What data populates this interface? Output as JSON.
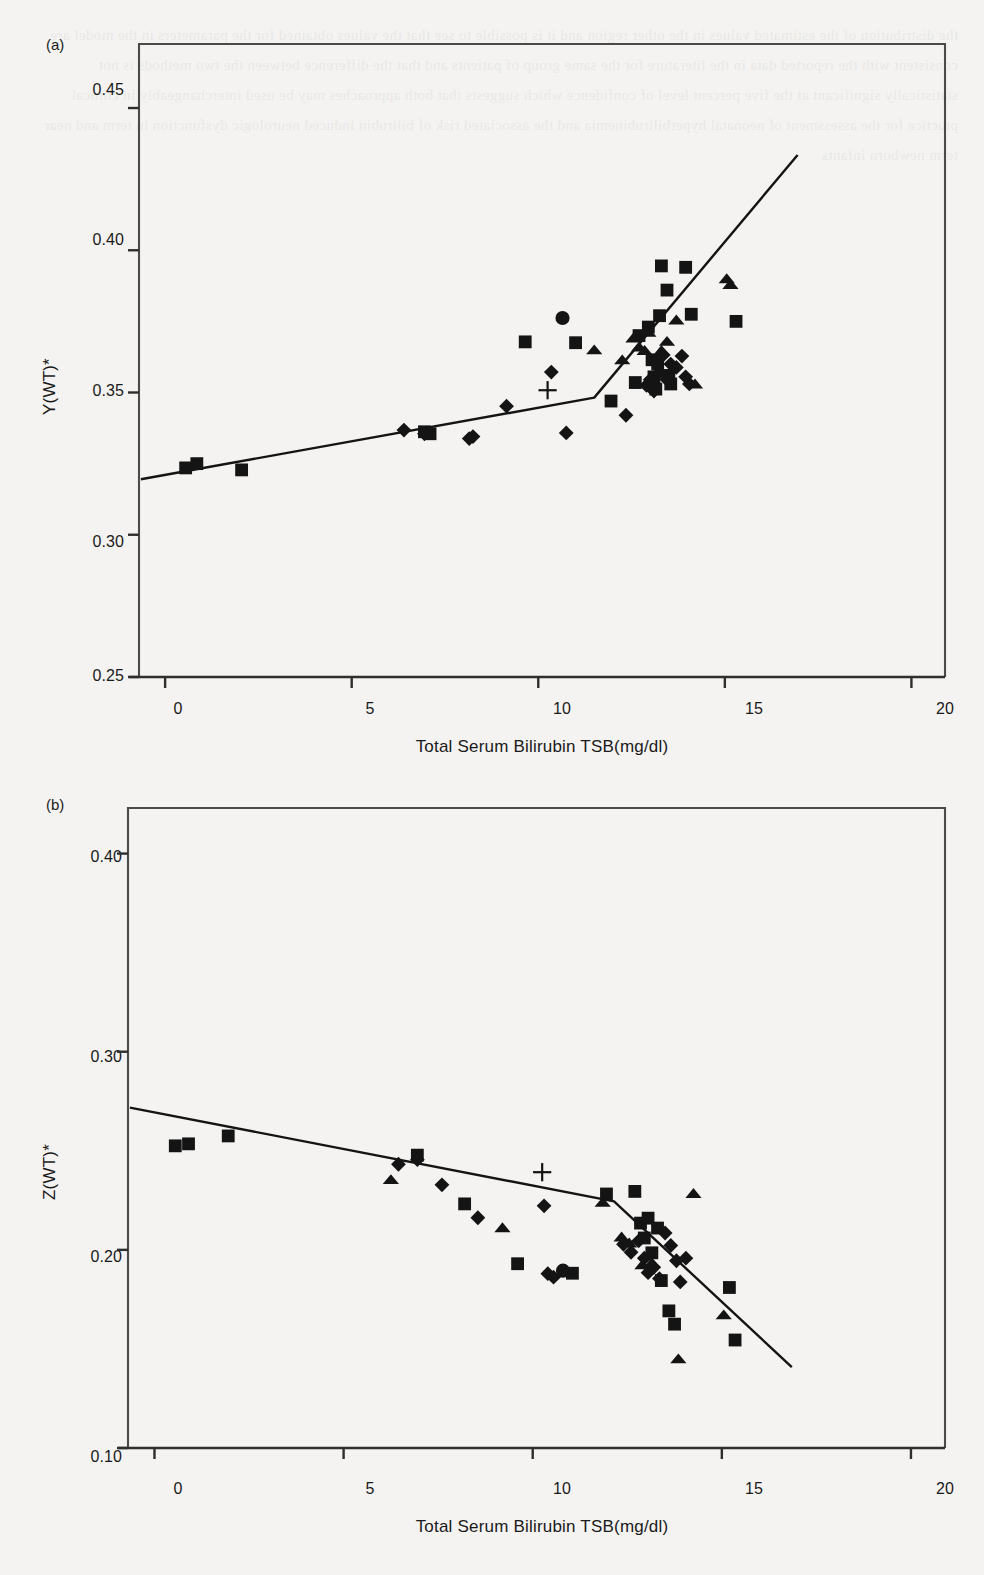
{
  "figure": {
    "background_color": "#f4f3f1",
    "ink_color": "#141414",
    "panels": [
      {
        "tag": "(a)",
        "ylabel": "Y(WT)*",
        "xlabel": "Total Serum Bilirubin TSB(mg/dl)",
        "yticks": [
          "0.45",
          "0.40",
          "0.35",
          "0.30",
          "0.25"
        ],
        "xticks": [
          "0",
          "5",
          "10",
          "15",
          "20"
        ]
      },
      {
        "tag": "(b)",
        "ylabel": "Z(WT)*",
        "xlabel": "Total Serum Bilirubin TSB(mg/dl)",
        "yticks": [
          "0.40",
          "0.30",
          "0.20",
          "0.10"
        ],
        "xticks": [
          "0",
          "5",
          "10",
          "15",
          "20"
        ]
      }
    ]
  },
  "chart_data": [
    {
      "type": "scatter",
      "panel": "(a)",
      "title": "",
      "xlabel": "Total Serum Bilirubin TSB(mg/dl)",
      "ylabel": "Y(WT)*",
      "xlim": [
        -0.7,
        20.9
      ],
      "ylim": [
        0.25,
        0.4725
      ],
      "xticks": [
        0,
        5,
        10,
        15,
        20
      ],
      "yticks": [
        0.25,
        0.3,
        0.35,
        0.4,
        0.45
      ],
      "grid": false,
      "legend": "none",
      "series": [
        {
          "name": "square",
          "marker": "square",
          "points": [
            [
              0.55,
              0.3235
            ],
            [
              0.85,
              0.325
            ],
            [
              2.05,
              0.3228
            ],
            [
              6.95,
              0.3362
            ],
            [
              7.1,
              0.3355
            ],
            [
              9.65,
              0.3678
            ],
            [
              11.0,
              0.3675
            ],
            [
              11.95,
              0.347
            ],
            [
              12.6,
              0.3535
            ],
            [
              12.7,
              0.37
            ],
            [
              12.95,
              0.373
            ],
            [
              13.05,
              0.3615
            ],
            [
              13.1,
              0.3555
            ],
            [
              13.15,
              0.3512
            ],
            [
              13.2,
              0.36
            ],
            [
              13.25,
              0.377
            ],
            [
              13.3,
              0.3945
            ],
            [
              13.45,
              0.386
            ],
            [
              13.5,
              0.356
            ],
            [
              13.55,
              0.353
            ],
            [
              13.95,
              0.394
            ],
            [
              14.1,
              0.3775
            ],
            [
              15.3,
              0.375
            ]
          ]
        },
        {
          "name": "diamond",
          "marker": "diamond",
          "points": [
            [
              6.4,
              0.3368
            ],
            [
              6.95,
              0.3355
            ],
            [
              8.15,
              0.3338
            ],
            [
              8.25,
              0.3345
            ],
            [
              9.15,
              0.3452
            ],
            [
              10.35,
              0.3572
            ],
            [
              10.75,
              0.3358
            ],
            [
              12.35,
              0.342
            ],
            [
              12.9,
              0.3525
            ],
            [
              13.0,
              0.3545
            ],
            [
              13.1,
              0.3505
            ],
            [
              13.25,
              0.357
            ],
            [
              13.35,
              0.3632
            ],
            [
              13.45,
              0.3545
            ],
            [
              13.55,
              0.36
            ],
            [
              13.7,
              0.3588
            ],
            [
              13.85,
              0.3628
            ],
            [
              13.95,
              0.3555
            ],
            [
              14.05,
              0.353
            ]
          ]
        },
        {
          "name": "triangle",
          "marker": "triangle",
          "points": [
            [
              11.5,
              0.365
            ],
            [
              12.25,
              0.3615
            ],
            [
              12.55,
              0.3692
            ],
            [
              12.7,
              0.366
            ],
            [
              12.85,
              0.3648
            ],
            [
              12.95,
              0.3712
            ],
            [
              13.3,
              0.3648
            ],
            [
              13.45,
              0.368
            ],
            [
              13.7,
              0.3755
            ],
            [
              14.2,
              0.353
            ],
            [
              15.05,
              0.39
            ],
            [
              15.15,
              0.388
            ]
          ]
        },
        {
          "name": "circle",
          "marker": "circle",
          "points": [
            [
              10.65,
              0.3762
            ]
          ]
        },
        {
          "name": "plus",
          "marker": "plus",
          "points": [
            [
              10.25,
              0.3508
            ]
          ]
        }
      ],
      "fit_line": {
        "style": "piecewise-linear",
        "vertices": [
          [
            -0.65,
            0.3195
          ],
          [
            11.5,
            0.3482
          ],
          [
            16.95,
            0.4335
          ]
        ]
      }
    },
    {
      "type": "scatter",
      "panel": "(b)",
      "title": "",
      "xlabel": "Total Serum Bilirubin TSB(mg/dl)",
      "ylabel": "Z(WT)*",
      "xlim": [
        -0.7,
        20.9
      ],
      "ylim": [
        0.1,
        0.423
      ],
      "xticks": [
        0,
        5,
        10,
        15,
        20
      ],
      "yticks": [
        0.1,
        0.2,
        0.3,
        0.4
      ],
      "grid": false,
      "legend": "none",
      "series": [
        {
          "name": "square",
          "marker": "square",
          "points": [
            [
              0.55,
              0.2525
            ],
            [
              0.9,
              0.2535
            ],
            [
              1.95,
              0.2575
            ],
            [
              6.95,
              0.2478
            ],
            [
              8.2,
              0.2232
            ],
            [
              9.6,
              0.193
            ],
            [
              11.05,
              0.1882
            ],
            [
              11.95,
              0.2282
            ],
            [
              12.7,
              0.2295
            ],
            [
              12.85,
              0.2135
            ],
            [
              12.95,
              0.206
            ],
            [
              13.05,
              0.216
            ],
            [
              13.15,
              0.1985
            ],
            [
              13.3,
              0.211
            ],
            [
              13.4,
              0.1845
            ],
            [
              13.6,
              0.1692
            ],
            [
              13.75,
              0.1625
            ],
            [
              15.2,
              0.181
            ],
            [
              15.35,
              0.1545
            ]
          ]
        },
        {
          "name": "diamond",
          "marker": "diamond",
          "points": [
            [
              6.45,
              0.2432
            ],
            [
              6.95,
              0.2455
            ],
            [
              7.6,
              0.2328
            ],
            [
              8.55,
              0.2162
            ],
            [
              10.3,
              0.2222
            ],
            [
              10.4,
              0.188
            ],
            [
              10.55,
              0.1862
            ],
            [
              12.4,
              0.2028
            ],
            [
              12.6,
              0.1988
            ],
            [
              12.8,
              0.2045
            ],
            [
              12.95,
              0.1958
            ],
            [
              13.05,
              0.1885
            ],
            [
              13.2,
              0.1912
            ],
            [
              13.35,
              0.1855
            ],
            [
              13.5,
              0.2085
            ],
            [
              13.65,
              0.2022
            ],
            [
              13.8,
              0.1945
            ],
            [
              13.9,
              0.1838
            ],
            [
              14.05,
              0.1958
            ]
          ]
        },
        {
          "name": "triangle",
          "marker": "triangle",
          "points": [
            [
              6.25,
              0.2355
            ],
            [
              9.2,
              0.2112
            ],
            [
              11.85,
              0.224
            ],
            [
              12.35,
              0.2065
            ],
            [
              12.55,
              0.2035
            ],
            [
              12.9,
              0.1925
            ],
            [
              13.15,
              0.1935
            ],
            [
              13.85,
              0.145
            ],
            [
              14.25,
              0.2285
            ],
            [
              15.05,
              0.1672
            ]
          ]
        },
        {
          "name": "circle",
          "marker": "circle",
          "points": [
            [
              10.8,
              0.1895
            ]
          ]
        },
        {
          "name": "plus",
          "marker": "plus",
          "points": [
            [
              10.25,
              0.2392
            ]
          ]
        }
      ],
      "fit_line": {
        "style": "piecewise-linear",
        "vertices": [
          [
            -0.65,
            0.2718
          ],
          [
            12.15,
            0.2245
          ],
          [
            16.85,
            0.1408
          ]
        ]
      }
    }
  ],
  "bleed_text": "the distribution of the estimated values in the other region and it is possible to see that the values obtained for the parameters in the model are consistent with the reported data in the literature for the same group of patients and that the difference between the two methods is not statistically significant at the five percent level of confidence which suggests that both approaches may be used interchangeably in clinical practice for the assessment of neonatal hyperbilirubinemia and the associated risk of bilirubin induced neurologic dysfunction in term and near term newborn infants"
}
